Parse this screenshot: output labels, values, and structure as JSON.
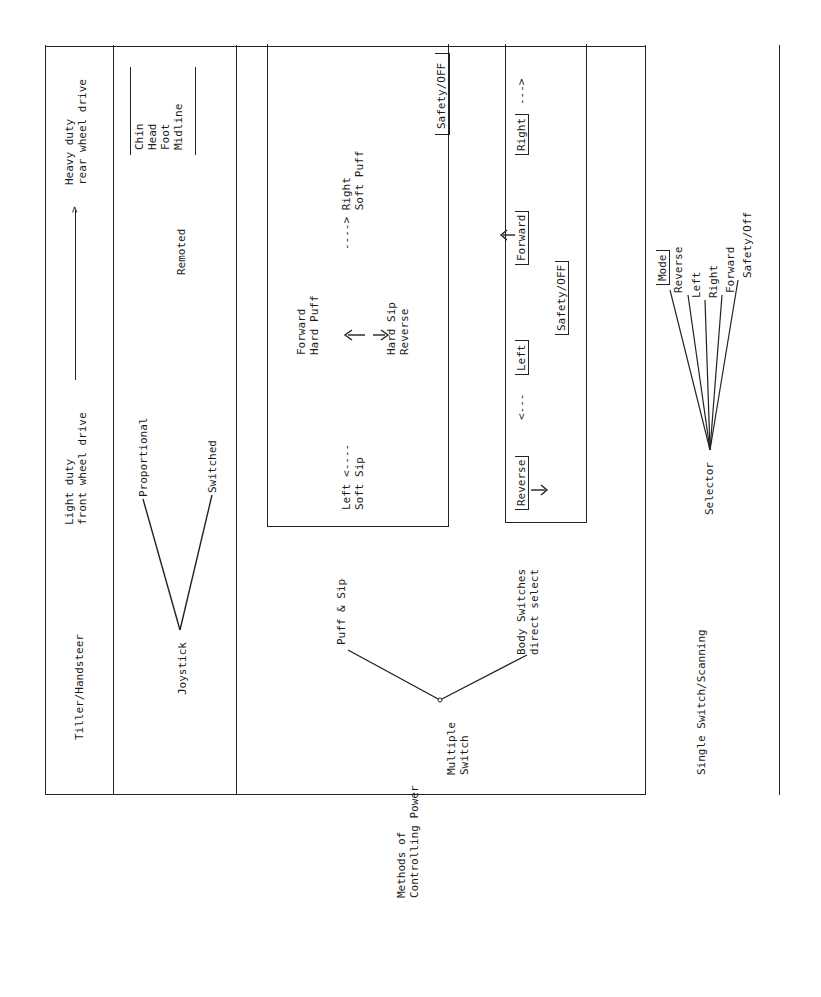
{
  "caption": "Methods of\nControlling Power",
  "row_tiller": {
    "label": "Tiller/Handsteer",
    "light": "Light duty\nfront wheel drive",
    "heavy": "Heavy duty\nrear wheel drive"
  },
  "row_joystick": {
    "root": "Joystick",
    "branches": [
      "Proportional",
      "Switched"
    ],
    "remoted": "Remoted",
    "remote_sites": "Chin\nHead\nFoot\nMidline"
  },
  "row_multiple": {
    "root": "Multiple\nSwitch",
    "branch_puff": "Puff & Sip",
    "branch_body": "Body Switches\ndirect select",
    "puff_box": {
      "forward": "Forward\nHard Puff",
      "reverse": "Hard Sip\nReverse",
      "left": "Left <----\nSoft Sip",
      "right": "----> Right\n      Soft Puff",
      "safety": "Safety/OFF"
    },
    "body_box": {
      "reverse": "Reverse",
      "left": "Left",
      "forward": "Forward",
      "right": "Right",
      "safety": "Safety/OFF"
    }
  },
  "row_single": {
    "label": "Single Switch/Scanning",
    "root": "Selector",
    "options": [
      "Mode",
      "Reverse",
      "Left",
      "Right",
      "Forward",
      "Safety/Off"
    ]
  }
}
